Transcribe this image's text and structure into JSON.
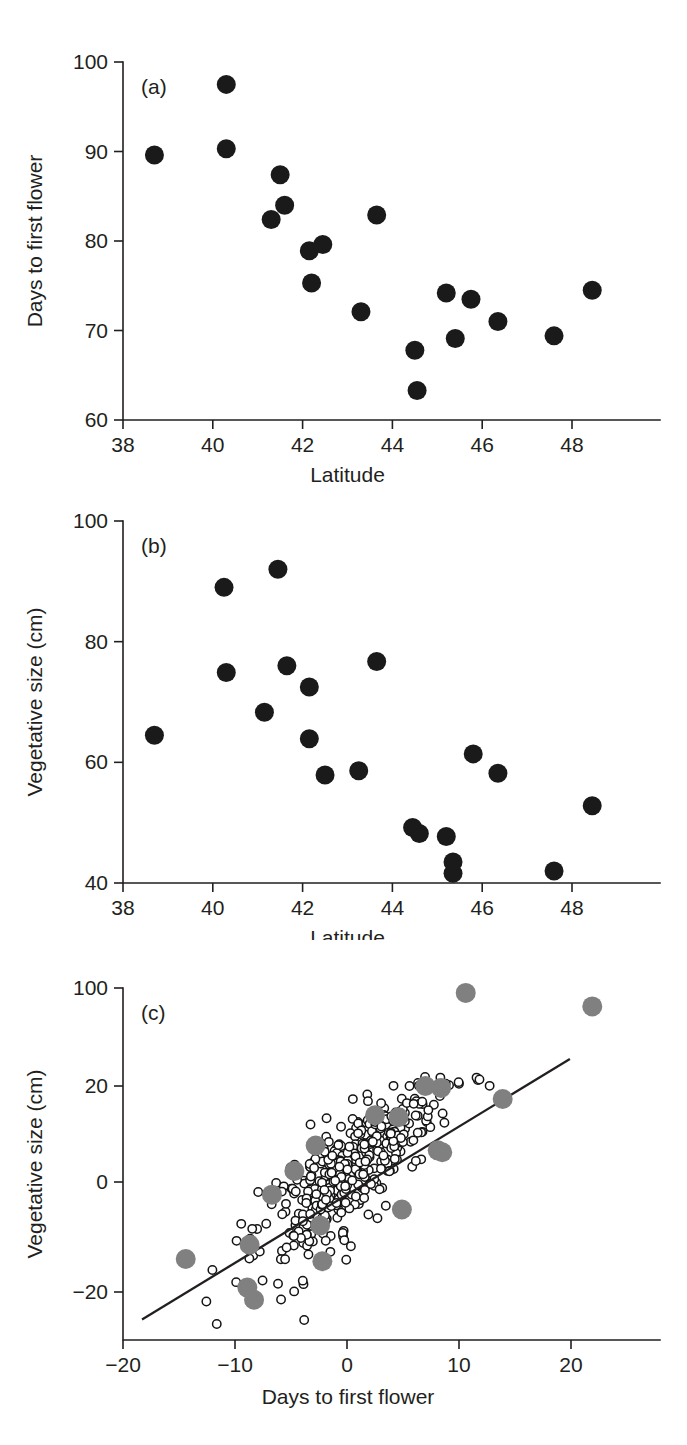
{
  "figure": {
    "panel_count": 3,
    "background_color": "#ffffff",
    "point_color_solid": "#1a1a1a",
    "point_color_gray": "#808080",
    "point_color_open": "#ffffff",
    "line_color": "#231f20"
  },
  "chart_data": [
    {
      "type": "scatter",
      "panel_label": "(a)",
      "title": "",
      "xlabel": "Latitude",
      "ylabel": "Days to first flower",
      "xlim": [
        38,
        49.2
      ],
      "ylim": [
        60,
        100
      ],
      "xticks": [
        38,
        40,
        42,
        44,
        46,
        48
      ],
      "xtick_labels": [
        "38",
        "40",
        "42",
        "44",
        "46",
        "48"
      ],
      "yticks": [
        60,
        70,
        80,
        90,
        100
      ],
      "ytick_labels": [
        "60",
        "70",
        "80",
        "90",
        "100"
      ],
      "grid": false,
      "legend": "none",
      "marker": "filled-circle",
      "points": [
        {
          "x": 38.7,
          "y": 89.6
        },
        {
          "x": 40.3,
          "y": 97.5
        },
        {
          "x": 40.3,
          "y": 90.3
        },
        {
          "x": 41.5,
          "y": 87.4
        },
        {
          "x": 41.3,
          "y": 82.4
        },
        {
          "x": 41.6,
          "y": 84.0
        },
        {
          "x": 42.15,
          "y": 78.9
        },
        {
          "x": 42.45,
          "y": 79.6
        },
        {
          "x": 42.2,
          "y": 75.3
        },
        {
          "x": 43.3,
          "y": 72.1
        },
        {
          "x": 43.65,
          "y": 82.9
        },
        {
          "x": 44.5,
          "y": 67.8
        },
        {
          "x": 44.55,
          "y": 63.3
        },
        {
          "x": 45.2,
          "y": 74.2
        },
        {
          "x": 45.4,
          "y": 69.1
        },
        {
          "x": 45.75,
          "y": 73.5
        },
        {
          "x": 46.35,
          "y": 71.0
        },
        {
          "x": 47.6,
          "y": 69.4
        },
        {
          "x": 48.45,
          "y": 74.5
        }
      ]
    },
    {
      "type": "scatter",
      "panel_label": "(b)",
      "title": "",
      "xlabel": "Latitude",
      "ylabel": "Vegetative size (cm)",
      "xlim": [
        38,
        49.2
      ],
      "ylim": [
        40,
        100
      ],
      "xticks": [
        38,
        40,
        42,
        44,
        46,
        48
      ],
      "xtick_labels": [
        "38",
        "40",
        "42",
        "44",
        "46",
        "48"
      ],
      "yticks": [
        40,
        60,
        80,
        100
      ],
      "ytick_labels": [
        "40",
        "60",
        "80",
        "100"
      ],
      "grid": false,
      "legend": "none",
      "marker": "filled-circle",
      "points": [
        {
          "x": 38.7,
          "y": 64.5
        },
        {
          "x": 40.25,
          "y": 89.0
        },
        {
          "x": 40.3,
          "y": 74.9
        },
        {
          "x": 41.15,
          "y": 68.3
        },
        {
          "x": 41.45,
          "y": 92.0
        },
        {
          "x": 41.65,
          "y": 76.0
        },
        {
          "x": 42.15,
          "y": 72.5
        },
        {
          "x": 42.15,
          "y": 63.9
        },
        {
          "x": 42.5,
          "y": 57.9
        },
        {
          "x": 43.25,
          "y": 58.6
        },
        {
          "x": 43.65,
          "y": 76.7
        },
        {
          "x": 44.45,
          "y": 49.2
        },
        {
          "x": 44.6,
          "y": 48.2
        },
        {
          "x": 45.2,
          "y": 47.7
        },
        {
          "x": 45.35,
          "y": 43.5
        },
        {
          "x": 45.35,
          "y": 41.6
        },
        {
          "x": 45.8,
          "y": 61.4
        },
        {
          "x": 46.35,
          "y": 58.2
        },
        {
          "x": 47.6,
          "y": 42.0
        },
        {
          "x": 48.45,
          "y": 52.8
        }
      ]
    },
    {
      "type": "scatter",
      "panel_label": "(c)",
      "title": "",
      "xlabel": "Days to first flower",
      "ylabel": "Vegetative size (cm)",
      "xlim": [
        -21.5,
        23.5
      ],
      "ylim": [
        -27,
        100
      ],
      "xticks": [
        -20,
        -10,
        0,
        10,
        20
      ],
      "xtick_labels": [
        "−20",
        "−10",
        "0",
        "10",
        "20"
      ],
      "yticks": [
        -20,
        0,
        20,
        100
      ],
      "ytick_labels": [
        "−20",
        "0",
        "20",
        "100"
      ],
      "y_axis_note": "upper segment compressed: 20 to 100 spans same pixel range as a short interval",
      "grid": false,
      "legend": "none",
      "fit_line": {
        "x0": -18.3,
        "y0": -25.0,
        "x1": 19.9,
        "y1": 42.0
      },
      "series": [
        {
          "name": "gray-filled-circles",
          "marker": "filled-circle-gray",
          "color": "#808080",
          "points": [
            {
              "x": 10.6,
              "y": 96.0
            },
            {
              "x": 21.9,
              "y": 85.0
            },
            {
              "x": 7.0,
              "y": 20.0
            },
            {
              "x": 8.4,
              "y": 19.6
            },
            {
              "x": 13.9,
              "y": 17.3
            },
            {
              "x": 2.5,
              "y": 13.9
            },
            {
              "x": 4.6,
              "y": 13.5
            },
            {
              "x": 8.1,
              "y": 6.6
            },
            {
              "x": 8.5,
              "y": 6.2
            },
            {
              "x": -2.8,
              "y": 7.6
            },
            {
              "x": -4.7,
              "y": 2.3
            },
            {
              "x": -6.7,
              "y": -2.3
            },
            {
              "x": -8.7,
              "y": -11.4
            },
            {
              "x": -2.4,
              "y": -7.9
            },
            {
              "x": 4.9,
              "y": -5.0
            },
            {
              "x": -2.2,
              "y": -14.4
            },
            {
              "x": -14.4,
              "y": -14.0
            },
            {
              "x": -8.9,
              "y": -19.2
            },
            {
              "x": -8.3,
              "y": -21.4
            }
          ]
        },
        {
          "name": "small-open-circles",
          "marker": "open-circle",
          "color": "#ffffff",
          "count_approx": 430,
          "description": "dense positively-correlated cloud centred near (0, 2) spreading from (-12,-25) to (20,60)"
        }
      ]
    }
  ]
}
